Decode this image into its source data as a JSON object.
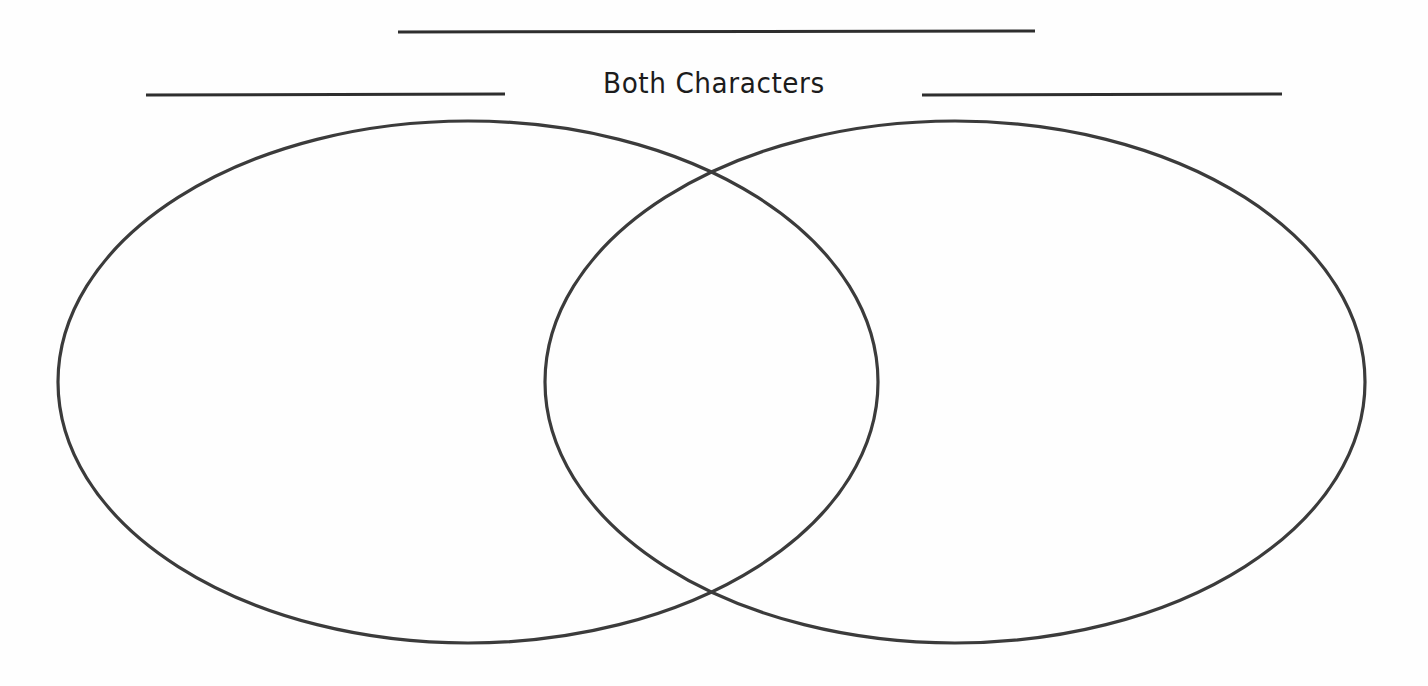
{
  "page": {
    "kind": "venn-diagram-worksheet",
    "background_color": "#fefefe",
    "width": 1428,
    "height": 686
  },
  "labels": {
    "center_heading": "Both Characters",
    "left_heading": "",
    "right_heading": ""
  },
  "blanks": [
    {
      "name": "center-top-blank",
      "purpose": "worksheet title write-in line",
      "x1": 398,
      "y1": 32,
      "x2": 1035,
      "y2": 31,
      "value": ""
    },
    {
      "name": "left-character-blank",
      "purpose": "left character name write-in line",
      "x1": 146,
      "y1": 95,
      "x2": 505,
      "y2": 94,
      "value": ""
    },
    {
      "name": "right-character-blank",
      "purpose": "right character name write-in line",
      "x1": 922,
      "y1": 95,
      "x2": 1282,
      "y2": 94,
      "value": ""
    }
  ],
  "chart_data": {
    "type": "diagram",
    "subtype": "venn",
    "title": "Both Characters",
    "stroke_color": "#3b3b3b",
    "stroke_width": 3.2,
    "fill": "none",
    "sets": [
      {
        "name": "left-character-set",
        "label": "",
        "cx": 468,
        "cy": 382,
        "rx": 410,
        "ry": 261,
        "contents": []
      },
      {
        "name": "right-character-set",
        "label": "",
        "cx": 955,
        "cy": 382,
        "rx": 410,
        "ry": 261,
        "contents": []
      }
    ],
    "intersection": {
      "name": "both-characters-region",
      "label": "Both Characters",
      "contents": [],
      "crossing_points": [
        {
          "x": 712,
          "y": 172
        },
        {
          "x": 712,
          "y": 592
        }
      ]
    }
  }
}
